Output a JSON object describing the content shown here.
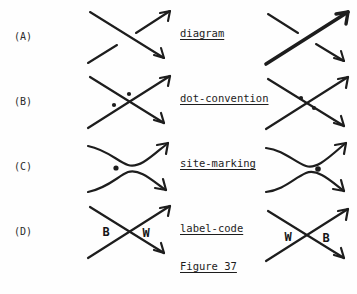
{
  "figure": {
    "caption": "Figure 37",
    "background_color": "#fefefe",
    "ink_color": "#1d1d1d"
  },
  "rows": [
    {
      "key": "A",
      "label": "(A)",
      "center_label": "diagram",
      "left_panel": {
        "name": "crossing-diagram-left-a",
        "description": "crossing with NW-SE strand over, SW-NE strand broken",
        "over_strand": "nw-se",
        "under_strand": "sw-ne",
        "bold_strand": "none",
        "dots": [],
        "letters": []
      },
      "right_panel": {
        "name": "crossing-diagram-right-a",
        "description": "crossing with bold SW-NE strand over, NW-SE strand broken",
        "over_strand": "sw-ne",
        "under_strand": "nw-se",
        "bold_strand": "sw-ne",
        "dots": [],
        "letters": []
      }
    },
    {
      "key": "B",
      "label": "(B)",
      "center_label": "dot-convention",
      "left_panel": {
        "name": "crossing-diagram-left-b",
        "description": "full X crossing with dots in north and west quadrants",
        "over_strand": "none",
        "under_strand": "none",
        "bold_strand": "none",
        "dots": [
          "north",
          "west"
        ],
        "letters": []
      },
      "right_panel": {
        "name": "crossing-diagram-right-b",
        "description": "full X crossing with dots in west and east quadrants",
        "over_strand": "none",
        "under_strand": "none",
        "bold_strand": "none",
        "dots": [
          "west",
          "east"
        ],
        "letters": []
      }
    },
    {
      "key": "C",
      "label": "(C)",
      "center_label": "site-marking",
      "left_panel": {
        "name": "smoothing-diagram-left-c",
        "description": "smoothed crossing, two curves with single dot on the west side",
        "over_strand": "none",
        "under_strand": "none",
        "bold_strand": "none",
        "dots": [
          "west"
        ],
        "letters": []
      },
      "right_panel": {
        "name": "smoothing-diagram-right-c",
        "description": "smoothed crossing, two curves with single dot on the east side",
        "over_strand": "none",
        "under_strand": "none",
        "bold_strand": "none",
        "dots": [
          "east"
        ],
        "letters": []
      }
    },
    {
      "key": "D",
      "label": "(D)",
      "center_label": "label-code",
      "left_panel": {
        "name": "labelled-crossing-left-d",
        "description": "full X crossing labelled B on the west and W on the east",
        "over_strand": "none",
        "under_strand": "none",
        "bold_strand": "none",
        "dots": [],
        "letters": [
          {
            "text": "B",
            "side": "west"
          },
          {
            "text": "W",
            "side": "east"
          }
        ]
      },
      "right_panel": {
        "name": "labelled-crossing-right-d",
        "description": "full X crossing labelled W on the west and B on the east",
        "over_strand": "none",
        "under_strand": "none",
        "bold_strand": "none",
        "dots": [],
        "letters": [
          {
            "text": "W",
            "side": "west"
          },
          {
            "text": "B",
            "side": "east"
          }
        ]
      }
    }
  ]
}
